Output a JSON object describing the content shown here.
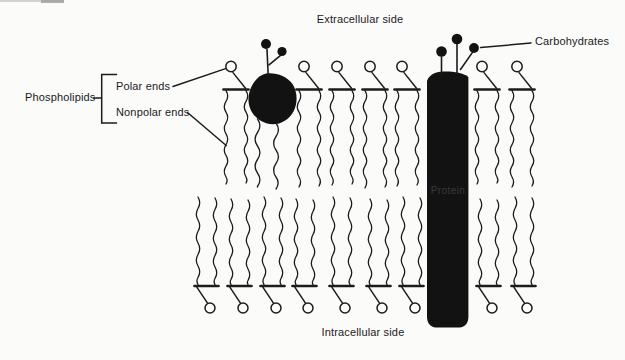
{
  "labels": {
    "extracellular_side": "Extracellular side",
    "carbohydrates": "Carbohydrates",
    "phospholipids": "Phospholipids",
    "polar_ends": "Polar ends",
    "nonpolar_ends": "Nonpolar ends",
    "protein": "Protein",
    "intracellular_side": "Intracellular side"
  },
  "colors": {
    "ink": "#1c1c1c",
    "black_fill": "#121212",
    "background": "#fbfbfa",
    "protein_label": "#3a3a3a"
  },
  "diagram": {
    "upper_phospholipid_x": [
      224,
      297,
      330,
      363,
      395,
      475,
      510
    ],
    "lower_phospholipid_x": [
      195,
      228,
      261,
      293,
      330,
      367,
      400,
      477,
      512
    ],
    "protein_column": {
      "x1": 427,
      "x2": 468.5,
      "y_top": 72,
      "y_bottom": 327.5
    },
    "blob_protein": {
      "cx": 272,
      "cy": 99
    },
    "carbohydrate_dots_on_column": 3,
    "carbohydrate_dots_on_blob": 2
  }
}
